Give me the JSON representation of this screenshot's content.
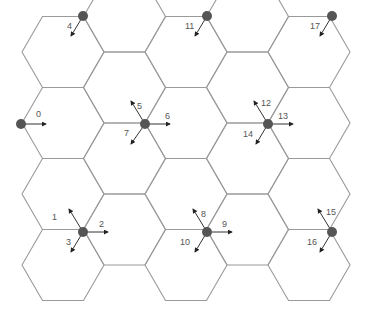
{
  "diagram": {
    "type": "hexagonal-cell-grid",
    "hex": {
      "radius": 41,
      "col_step": 61.5,
      "row_step": 71,
      "origin_x": 63,
      "origin_y": 52
    },
    "grid_columns": [
      {
        "cx": 63,
        "rows": [
          52,
          123,
          194,
          265
        ]
      },
      {
        "cx": 124.5,
        "rows": [
          16.5,
          87.5,
          158.5,
          229.5
        ]
      },
      {
        "cx": 186,
        "rows": [
          52,
          123,
          194,
          265
        ]
      },
      {
        "cx": 247.5,
        "rows": [
          16.5,
          87.5,
          158.5,
          229.5
        ]
      },
      {
        "cx": 309,
        "rows": [
          52,
          123,
          194,
          265
        ]
      }
    ],
    "colors": {
      "hex_stroke": "#9a9a9a",
      "node": "#555555",
      "arrow": "#333333",
      "label": "#555555"
    },
    "nodes": [
      {
        "id": "n-a",
        "x": 83,
        "y": 16,
        "arrows": [
          {
            "label": "4",
            "dx": -12,
            "dy": 20,
            "lx": -16,
            "ly": 13
          }
        ]
      },
      {
        "id": "n-b",
        "x": 207,
        "y": 16,
        "arrows": [
          {
            "label": "11",
            "dx": -12,
            "dy": 20,
            "lx": -22,
            "ly": 13
          }
        ]
      },
      {
        "id": "n-c",
        "x": 332,
        "y": 16,
        "arrows": [
          {
            "label": "17",
            "dx": -12,
            "dy": 20,
            "lx": -22,
            "ly": 13
          }
        ]
      },
      {
        "id": "n-d",
        "x": 21,
        "y": 124,
        "arrows": [
          {
            "label": "0",
            "dx": 25,
            "dy": 0,
            "lx": 15,
            "ly": -7
          }
        ]
      },
      {
        "id": "n-e",
        "x": 145,
        "y": 124,
        "arrows": [
          {
            "label": "5",
            "dx": -14,
            "dy": -23,
            "lx": -8,
            "ly": -15
          },
          {
            "label": "6",
            "dx": 25,
            "dy": 0,
            "lx": 20,
            "ly": -5
          },
          {
            "label": "7",
            "dx": -14,
            "dy": 20,
            "lx": -21,
            "ly": 12
          }
        ]
      },
      {
        "id": "n-f",
        "x": 268,
        "y": 124,
        "arrows": [
          {
            "label": "12",
            "dx": -14,
            "dy": -23,
            "lx": -7,
            "ly": -18
          },
          {
            "label": "13",
            "dx": 25,
            "dy": 0,
            "lx": 10,
            "ly": -5
          },
          {
            "label": "14",
            "dx": -12,
            "dy": 20,
            "lx": -25,
            "ly": 13
          }
        ]
      },
      {
        "id": "n-g",
        "x": 83,
        "y": 232,
        "arrows": [
          {
            "label": "1",
            "dx": -14,
            "dy": -23,
            "lx": -31,
            "ly": -12
          },
          {
            "label": "2",
            "dx": 25,
            "dy": 0,
            "lx": 16,
            "ly": -5
          },
          {
            "label": "3",
            "dx": -12,
            "dy": 20,
            "lx": -17,
            "ly": 13
          }
        ]
      },
      {
        "id": "n-h",
        "x": 207,
        "y": 232,
        "arrows": [
          {
            "label": "8",
            "dx": -14,
            "dy": -23,
            "lx": -6,
            "ly": -15
          },
          {
            "label": "9",
            "dx": 25,
            "dy": 0,
            "lx": 15,
            "ly": -5
          },
          {
            "label": "10",
            "dx": -12,
            "dy": 20,
            "lx": -27,
            "ly": 13
          }
        ]
      },
      {
        "id": "n-i",
        "x": 332,
        "y": 232,
        "arrows": [
          {
            "label": "15",
            "dx": -14,
            "dy": -23,
            "lx": -6,
            "ly": -17
          },
          {
            "label": "16",
            "dx": -12,
            "dy": 20,
            "lx": -25,
            "ly": 13
          }
        ]
      }
    ],
    "labels": [
      "0",
      "1",
      "2",
      "3",
      "4",
      "5",
      "6",
      "7",
      "8",
      "9",
      "10",
      "11",
      "12",
      "13",
      "14",
      "15",
      "16",
      "17"
    ]
  }
}
